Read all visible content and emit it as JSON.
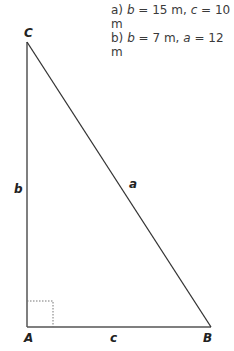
{
  "problems": [
    {
      "label": "a)",
      "v1_name": "b",
      "v1": "= 15 m,",
      "v2_name": "c",
      "v2": "= 10 m"
    },
    {
      "label": "b)",
      "v1_name": "b",
      "v1": "= 7 m,",
      "v2_name": "a",
      "v2": "= 12 m"
    }
  ],
  "vertices": {
    "A": "A",
    "B": "B",
    "C": "C"
  },
  "sides": {
    "a": "a",
    "b": "b",
    "c": "c"
  }
}
